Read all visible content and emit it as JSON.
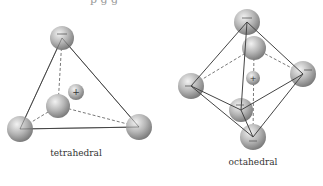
{
  "figure": {
    "top_caption_partial": "p g g",
    "panels": [
      {
        "label": "tetrahedral",
        "vertices_anion": 4,
        "center_cation": 1
      },
      {
        "label": "octahedral",
        "vertices_anion": 6,
        "center_cation": 1
      }
    ],
    "anion_sign": "−",
    "cation_sign": "+"
  },
  "colors": {
    "sphere_light": "#e6e6e6",
    "sphere_dark": "#8a8a8a",
    "edge": "#444444",
    "label": "#333333"
  }
}
